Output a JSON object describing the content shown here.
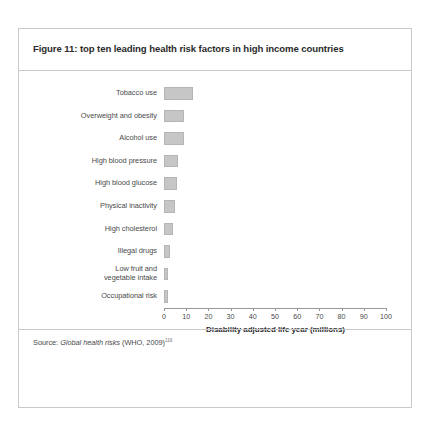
{
  "figure": {
    "title": "Figure 11: top ten leading health risk factors in high income countries",
    "source_prefix": "Source: ",
    "source_italic": "Global health risks",
    "source_suffix": " (WHO, 2009)",
    "source_superscript": "116"
  },
  "chart_data": {
    "type": "bar",
    "orientation": "horizontal",
    "title": "Figure 11: top ten leading health risk factors in high income countries",
    "xlabel": "Disability adjusted life year (millions)",
    "ylabel": "",
    "xlim": [
      0,
      100
    ],
    "grid": false,
    "legend": "none",
    "xticks": [
      0,
      10,
      20,
      30,
      40,
      50,
      60,
      70,
      80,
      90,
      100
    ],
    "xtick_labels": [
      "0",
      "10",
      "20",
      "30",
      "40",
      "50",
      "60",
      "70",
      "80",
      "90",
      "100"
    ],
    "categories": [
      "Tobacco use",
      "Overweight and obesity",
      "Alcohol use",
      "High blood pressure",
      "High blood glucose",
      "Physical inactivity",
      "High cholesterol",
      "Illegal drugs",
      "Low fruit and\nvegetable intake",
      "Occupational risk"
    ],
    "values": [
      13.0,
      9.0,
      9.0,
      6.5,
      6.0,
      5.0,
      4.0,
      2.5,
      2.0,
      2.0
    ],
    "bar_color": "#c6c6c6"
  },
  "categories": [
    {
      "label_line1": "Tobacco use",
      "label_line2": "",
      "value": 13.0
    },
    {
      "label_line1": "Overweight and obesity",
      "label_line2": "",
      "value": 9.0
    },
    {
      "label_line1": "Alcohol use",
      "label_line2": "",
      "value": 9.0
    },
    {
      "label_line1": "High blood pressure",
      "label_line2": "",
      "value": 6.5
    },
    {
      "label_line1": "High blood glucose",
      "label_line2": "",
      "value": 6.0
    },
    {
      "label_line1": "Physical inactivity",
      "label_line2": "",
      "value": 5.0
    },
    {
      "label_line1": "High cholesterol",
      "label_line2": "",
      "value": 4.0
    },
    {
      "label_line1": "Illegal drugs",
      "label_line2": "",
      "value": 2.5
    },
    {
      "label_line1": "Low fruit and",
      "label_line2": "vegetable intake",
      "value": 2.0
    },
    {
      "label_line1": "Occupational risk",
      "label_line2": "",
      "value": 2.0
    }
  ]
}
